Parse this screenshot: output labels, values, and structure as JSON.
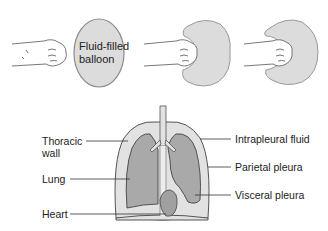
{
  "top_panel": {
    "balloon_label_line1": "Fluid-filled",
    "balloon_label_line2": "balloon",
    "stages": [
      {
        "id": 1,
        "description": "fist approaching balloon"
      },
      {
        "id": 2,
        "description": "intact balloon"
      },
      {
        "id": 3,
        "description": "fist pressing into balloon"
      },
      {
        "id": 4,
        "description": "fist enveloped by balloon"
      }
    ]
  },
  "bottom_panel": {
    "labels_left": {
      "thoracic_wall_line1": "Thoracic",
      "thoracic_wall_line2": "wall",
      "lung": "Lung",
      "heart": "Heart"
    },
    "labels_right": {
      "intrapleural_fluid": "Intrapleural fluid",
      "parietal_pleura": "Parietal pleura",
      "visceral_pleura": "Visceral pleura"
    }
  },
  "colors": {
    "balloon_fill": "#dcdcdc",
    "lung_fill": "#a9a9a9",
    "pleura_fill": "#e2e2e2",
    "outline": "#555555",
    "leader_line": "#333333",
    "skin": "#ffffff"
  }
}
